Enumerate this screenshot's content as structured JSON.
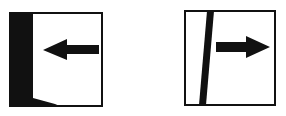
{
  "panels": [
    {
      "name": "left-panel",
      "description": "Box with thick black band on the left edge and an arrow pointing left",
      "arrow_direction": "left"
    },
    {
      "name": "right-panel",
      "description": "Box with a slanted black bar near the left and an arrow pointing right",
      "arrow_direction": "right"
    }
  ],
  "colors": {
    "ink": "#111111",
    "background": "#ffffff"
  }
}
